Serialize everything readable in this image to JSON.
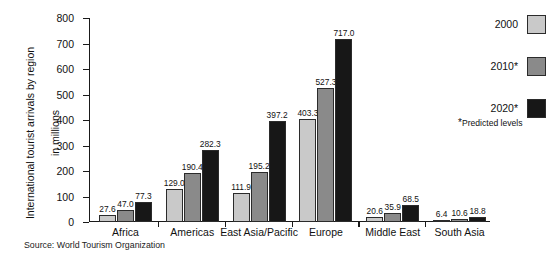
{
  "chart_data": {
    "type": "bar",
    "title": "",
    "xlabel": "",
    "ylabel": "International tourist arrivals by region\nin millions",
    "ylim": [
      0,
      800
    ],
    "yticks": [
      0,
      100,
      200,
      300,
      400,
      500,
      600,
      700,
      800
    ],
    "ytick_labels": [
      "0",
      "100",
      "200",
      "300",
      "400",
      "500",
      "600",
      "700",
      "800"
    ],
    "grid": false,
    "legend_position": "right",
    "categories": [
      "Africa",
      "Americas",
      "East Asia/Pacific",
      "Europe",
      "Middle East",
      "South Asia"
    ],
    "series": [
      {
        "name": "2000",
        "color": "#c9c9c9",
        "values": [
          27.6,
          129.0,
          111.9,
          403.3,
          20.6,
          6.4
        ],
        "labels": [
          "27.6",
          "129.0",
          "111.9",
          "403.3",
          "20.6",
          "6.4"
        ]
      },
      {
        "name": "2010*",
        "color": "#8a8a8a",
        "values": [
          47.0,
          190.4,
          195.2,
          527.3,
          35.9,
          10.6
        ],
        "labels": [
          "47.0",
          "190.4",
          "195.2",
          "527.3",
          "35.9",
          "10.6"
        ]
      },
      {
        "name": "2020*",
        "color": "#171717",
        "values": [
          77.3,
          282.3,
          397.2,
          717.0,
          68.5,
          18.8
        ],
        "labels": [
          "77.3",
          "282.3",
          "397.2",
          "717.0",
          "68.5",
          "18.8"
        ]
      }
    ],
    "annotations": {
      "legend_note": "Predicted levels",
      "legend_note_marker": "*",
      "source": "Source:  World Tourism Organization"
    }
  },
  "axis": {
    "y_title_line1": "International tourist arrivals by region",
    "y_title_line2": "in millions",
    "tick_800": "800",
    "tick_700": "700",
    "tick_600": "600",
    "tick_500": "500",
    "tick_400": "400",
    "tick_300": "300",
    "tick_200": "200",
    "tick_100": "100",
    "tick_0": "0"
  },
  "groups": {
    "g0": "Africa",
    "g1": "Americas",
    "g2": "East Asia/Pacific",
    "g3": "Europe",
    "g4": "Middle East",
    "g5": "South Asia"
  },
  "legend": {
    "item0": "2000",
    "item1": "2010*",
    "item2": "2020*",
    "note_marker": "*",
    "note": "Predicted levels"
  },
  "source": {
    "text": "Source:  World Tourism Organization"
  }
}
